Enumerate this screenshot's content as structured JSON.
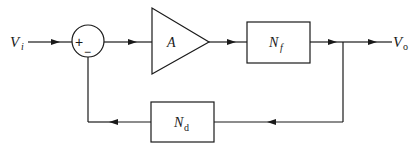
{
  "diagram": {
    "type": "block-diagram",
    "input": {
      "symbol": "V",
      "subscript": "i"
    },
    "output": {
      "symbol": "V",
      "subscript": "o"
    },
    "summing_junction": {
      "plus_sign": "+",
      "minus_sign": "−"
    },
    "amplifier": {
      "label": "A"
    },
    "forward_block": {
      "symbol": "N",
      "subscript": "f"
    },
    "feedback_block": {
      "symbol": "N",
      "subscript": "d"
    },
    "colors": {
      "stroke": "#1a1a1a",
      "background": "#ffffff"
    }
  }
}
